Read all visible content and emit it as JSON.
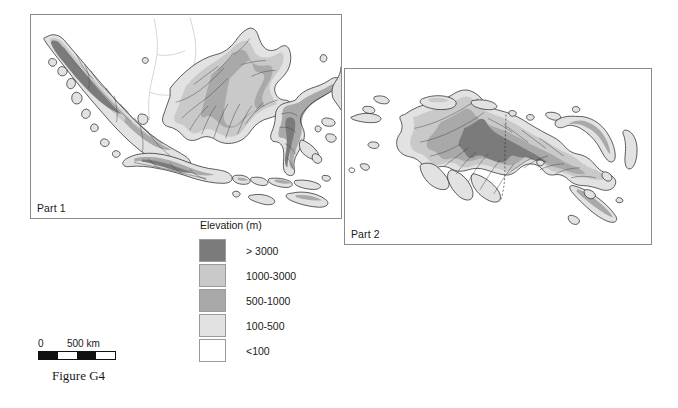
{
  "figure": {
    "caption": "Figure G4"
  },
  "panels": [
    {
      "id": "part1",
      "label": "Part 1"
    },
    {
      "id": "part2",
      "label": "Part 2"
    }
  ],
  "legend": {
    "title": "Elevation (m)",
    "entries": [
      {
        "label": "> 3000",
        "color": "#7b7b7b"
      },
      {
        "label": "1000-3000",
        "color": "#c9c9c9"
      },
      {
        "label": "500-1000",
        "color": "#a9a9a9"
      },
      {
        "label": "100-500",
        "color": "#e2e2e2"
      },
      {
        "label": "<100",
        "color": "#ffffff"
      }
    ]
  },
  "scalebar": {
    "start_label": "0",
    "end_label": "500 km",
    "segments": [
      "dark",
      "light",
      "dark",
      "light"
    ]
  },
  "colors": {
    "frame_border": "#8a8a8a",
    "coastline": "#1b1b1b",
    "river": "#3d3d3d",
    "text": "#1a1a1a"
  }
}
